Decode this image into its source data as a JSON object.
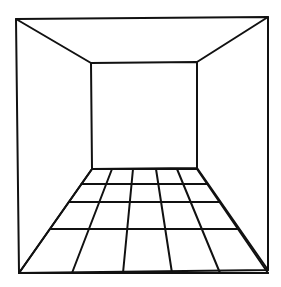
{
  "diagram": {
    "type": "one-point-perspective-room",
    "stroke_color": "#111111",
    "background": "#ffffff",
    "outer_frame": [
      [
        16,
        19
      ],
      [
        268,
        17
      ],
      [
        268,
        270
      ],
      [
        19,
        273
      ]
    ],
    "back_wall": [
      [
        91,
        63
      ],
      [
        197,
        62
      ],
      [
        197,
        168
      ],
      [
        92,
        169
      ]
    ],
    "floor_grid": {
      "columns": 5,
      "rows": 4,
      "horizontal_y": [
        169,
        184,
        202,
        229,
        273
      ],
      "back_x": [
        92,
        112,
        133,
        156,
        177,
        197
      ],
      "front_x": [
        19,
        72,
        123,
        172,
        220,
        268
      ]
    }
  }
}
